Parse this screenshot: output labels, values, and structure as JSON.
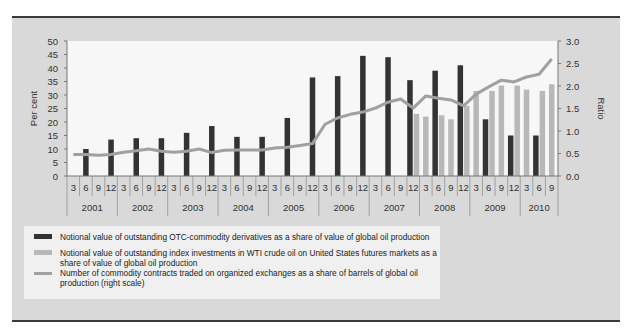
{
  "chart_data": {
    "type": "bar+line",
    "title": "",
    "ylabel": "Per cent",
    "y2label": "Ratio",
    "ylim": [
      0,
      50
    ],
    "y2lim": [
      0,
      3.0
    ],
    "yticks": [
      0,
      5,
      10,
      15,
      20,
      25,
      30,
      35,
      40,
      45,
      50
    ],
    "y2ticks": [
      "0.0",
      "0.5",
      "1.0",
      "1.5",
      "2.0",
      "2.5",
      "3.0"
    ],
    "years": [
      "2001",
      "2002",
      "2003",
      "2004",
      "2005",
      "2006",
      "2007",
      "2008",
      "2009",
      "2010"
    ],
    "quarter_labels": [
      "3",
      "6",
      "9",
      "12"
    ],
    "categories": [
      "2001-3",
      "2001-6",
      "2001-9",
      "2001-12",
      "2002-3",
      "2002-6",
      "2002-9",
      "2002-12",
      "2003-3",
      "2003-6",
      "2003-9",
      "2003-12",
      "2004-3",
      "2004-6",
      "2004-9",
      "2004-12",
      "2005-3",
      "2005-6",
      "2005-9",
      "2005-12",
      "2006-3",
      "2006-6",
      "2006-9",
      "2006-12",
      "2007-3",
      "2007-6",
      "2007-9",
      "2007-12",
      "2008-3",
      "2008-6",
      "2008-9",
      "2008-12",
      "2009-3",
      "2009-6",
      "2009-9",
      "2009-12",
      "2010-3",
      "2010-6",
      "2010-9"
    ],
    "series": [
      {
        "name": "Notional value of outstanding OTC-commodity derivatives as a share of value of global oil production",
        "type": "bar",
        "axis": "left",
        "color": "#333333",
        "values": [
          null,
          10,
          null,
          13.5,
          null,
          14,
          null,
          14,
          null,
          16,
          null,
          18.5,
          null,
          14.5,
          null,
          14.5,
          null,
          21.5,
          null,
          36.5,
          null,
          37,
          null,
          44.5,
          null,
          44,
          null,
          35.5,
          null,
          39,
          null,
          41,
          null,
          21,
          null,
          15,
          null,
          15,
          null
        ]
      },
      {
        "name": "Notional value of outstanding index investments in WTI crude oil on United States futures markets as a share of value of global oil production",
        "type": "bar",
        "axis": "left",
        "color": "#b8b8b8",
        "values": [
          null,
          null,
          null,
          null,
          null,
          null,
          null,
          null,
          null,
          null,
          null,
          null,
          null,
          null,
          null,
          null,
          null,
          null,
          null,
          null,
          null,
          null,
          null,
          null,
          null,
          null,
          null,
          23,
          22,
          22.5,
          21,
          26,
          31.5,
          31.5,
          33.5,
          33.5,
          32,
          31.5,
          34
        ]
      },
      {
        "name": "Number of commodity contracts traded on organized exchanges as a share of barrels of global oil production (right scale)",
        "type": "line",
        "axis": "right",
        "color": "#a0a0a0",
        "values": [
          0.48,
          0.48,
          0.46,
          0.48,
          0.53,
          0.56,
          0.6,
          0.55,
          0.53,
          0.55,
          0.6,
          0.52,
          0.57,
          0.58,
          0.58,
          0.58,
          0.62,
          0.64,
          0.68,
          0.72,
          1.15,
          1.29,
          1.37,
          1.42,
          1.51,
          1.64,
          1.71,
          1.51,
          1.78,
          1.73,
          1.69,
          1.56,
          1.82,
          1.98,
          2.13,
          2.09,
          2.2,
          2.26,
          2.6
        ]
      }
    ],
    "legend_position": "bottom",
    "grid": false
  },
  "legend": {
    "items": [
      {
        "label": "Notional value of outstanding OTC-commodity derivatives as a share of value of global oil production"
      },
      {
        "label": "Notional value of outstanding index investments in WTI crude oil on United States futures markets as a share of value of global oil production"
      },
      {
        "label": "Number of commodity contracts traded on organized exchanges as a share of barrels of global oil production (right scale)"
      }
    ]
  },
  "axes": {
    "left_title": "Per cent",
    "right_title": "Ratio"
  }
}
